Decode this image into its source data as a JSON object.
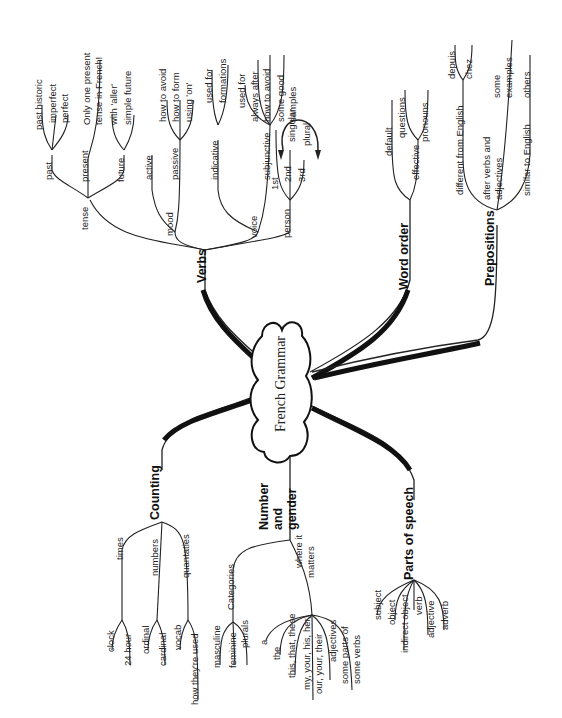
{
  "title": "French Grammar",
  "branches": {
    "verbs": {
      "label": "Verbs",
      "tense": {
        "label": "tense",
        "past": "past",
        "past_children": [
          "past historic",
          "imperfect",
          "perfect"
        ],
        "present": "present",
        "present_children": [
          "Only one present",
          "tense in French!"
        ],
        "future": "future",
        "future_children": [
          "with 'aller'",
          "simple future"
        ]
      },
      "mood": {
        "label": "mood",
        "active": "active",
        "passive": "passive",
        "passive_children": [
          "how to avoid",
          "how to form",
          "using 'on'"
        ]
      },
      "voice": {
        "label": "voice",
        "indicative": "indicative",
        "indicative_children": [
          "used for",
          "formations"
        ],
        "subjunctive": "subjunctive",
        "subjunctive_children": [
          "used for",
          "always after",
          "how to avoid",
          "some good",
          "samples"
        ]
      },
      "person": {
        "label": "person",
        "children": [
          "1st",
          "2nd",
          "3rd"
        ],
        "singular": "singular",
        "plural": "plural"
      }
    },
    "word_order": {
      "label": "Word order",
      "default": "default",
      "effective": "effective",
      "effective_children": [
        "questions",
        "pronouns"
      ]
    },
    "prepositions": {
      "label": "Prepositions",
      "different": "different from English",
      "different_children": [
        "depuis",
        "chez"
      ],
      "after_verbs": [
        "after verbs and",
        "adjectives"
      ],
      "after_children": [
        "some",
        "examples"
      ],
      "similar": "similar to English",
      "similar_children": [
        "others"
      ]
    },
    "counting": {
      "label": "Counting",
      "times": "times",
      "times_children": [
        "clock",
        "24 hour"
      ],
      "numbers": "numbers",
      "numbers_children": [
        "ordinal",
        "cardinal"
      ],
      "quantaties": "quantaties",
      "quantaties_children": [
        "vocab",
        "how they're used"
      ]
    },
    "number_gender": {
      "label": [
        "Number",
        "and",
        "gender"
      ],
      "categories": "Categories",
      "categories_children": [
        "masculine",
        "feminine",
        "plurals"
      ],
      "where": [
        "where it",
        "matters"
      ],
      "where_children": [
        "a",
        "the",
        "this, that, these",
        "my, your, his, her,",
        "our, your, their",
        "adjectives",
        "some parts of",
        "some verbs"
      ]
    },
    "parts_of_speech": {
      "label": "Parts of speech",
      "children": [
        "subject",
        "object",
        "indirect object",
        "verb",
        "adjective",
        "adverb"
      ]
    }
  }
}
